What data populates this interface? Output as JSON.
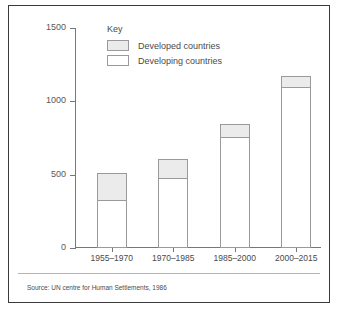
{
  "chart_data": {
    "type": "bar",
    "subtype": "stacked-bar",
    "title": "",
    "xlabel": "",
    "ylabel": "",
    "ylim": [
      0,
      1500
    ],
    "yticks": [
      0,
      500,
      1000,
      1500
    ],
    "grid": false,
    "legend_position": "inside-top-left",
    "legend_title": "Key",
    "categories": [
      "1955–1970",
      "1970–1985",
      "1985–2000",
      "2000–2015"
    ],
    "series": [
      {
        "name": "Developing countries",
        "color": "#ffffff",
        "values": [
          330,
          480,
          760,
          1100
        ]
      },
      {
        "name": "Developed countries",
        "color": "#ebebeb",
        "values": [
          185,
          135,
          90,
          80
        ]
      }
    ],
    "totals": [
      515,
      615,
      850,
      1180
    ]
  },
  "axis": {
    "tick_labels": [
      "1500",
      "1000",
      "500",
      "0"
    ]
  },
  "legend": {
    "title": "Key",
    "items": [
      {
        "label": "Developed countries",
        "swatch": "grey-swatch"
      },
      {
        "label": "Developing countries",
        "swatch": "white-swatch"
      }
    ]
  },
  "source": {
    "text": "Source: UN centre for Human Settlements, 1986"
  },
  "colors": {
    "developed_fill": "#ebebeb",
    "developing_fill": "#ffffff",
    "bar_outline": "#9a9a9c",
    "axis": "#77777a",
    "frame": "#3a3a3a",
    "text": "#4a4a4c"
  }
}
